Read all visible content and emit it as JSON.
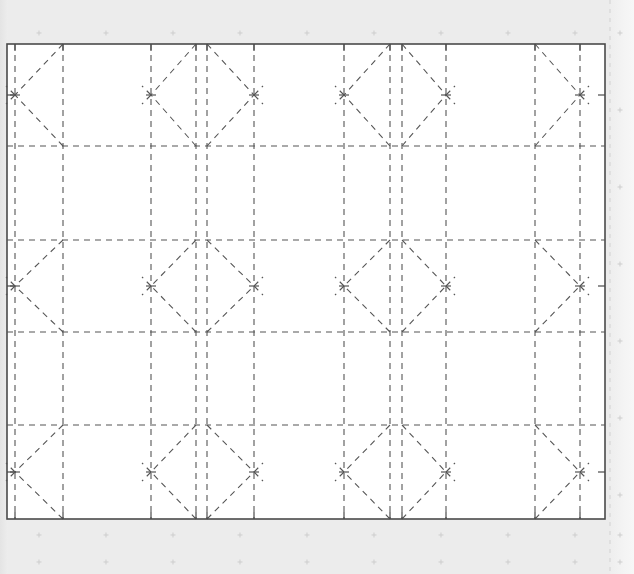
{
  "app": {
    "title": "Pattern Canvas",
    "background_color": "#ececec",
    "canvas_fill": "#ffffff",
    "canvas_border_color": "#4a4a4a",
    "line_color": "#555555",
    "marker_color": "#c8c8c8",
    "guide_color": "#cfcfcf"
  },
  "canvas": {
    "name": "drawing-canvas",
    "x": 7,
    "y": 44,
    "width": 598,
    "height": 475,
    "border_width": 1.6
  },
  "geometry": {
    "dash_pattern": "6 5",
    "stroke_width": 1.1,
    "vertical_lines": [
      15,
      63,
      151,
      196,
      207,
      254,
      344,
      390,
      402,
      446,
      535,
      580
    ],
    "horizontal_lines": [
      146,
      240,
      332,
      425
    ],
    "bands": [
      {
        "name": "top-band",
        "top": 44,
        "bottom": 146,
        "mid": 95
      },
      {
        "name": "middle-band",
        "top": 240,
        "bottom": 332,
        "mid": 286
      },
      {
        "name": "bottom-band",
        "top": 425,
        "bottom": 519,
        "mid": 472
      }
    ],
    "diagonal_cells": [
      {
        "left": 15,
        "right": 63,
        "vertex": "left"
      },
      {
        "left": 151,
        "right": 196,
        "vertex": "left"
      },
      {
        "left": 207,
        "right": 254,
        "vertex": "right"
      },
      {
        "left": 344,
        "right": 390,
        "vertex": "left"
      },
      {
        "left": 402,
        "right": 446,
        "vertex": "right"
      },
      {
        "left": 535,
        "right": 580,
        "vertex": "right"
      }
    ],
    "edge_ticks": {
      "length": 7,
      "left_x": 7,
      "right_x": 605,
      "top_y": 44,
      "bottom_y": 519
    }
  },
  "markers": {
    "name": "registration-marks",
    "glyph": "plus",
    "size": 5,
    "columns": [
      39,
      106,
      173,
      240,
      307,
      374,
      441,
      508,
      575
    ],
    "rows": [
      33,
      110,
      187,
      264,
      341,
      418,
      495,
      535,
      562
    ],
    "outside_columns": [
      620
    ],
    "color": "#cdcdcd"
  },
  "guides": {
    "name": "vertical-guide",
    "x": 610,
    "color": "#d2d2d2",
    "dash": "4 5"
  },
  "status": {
    "visible_text": ""
  }
}
